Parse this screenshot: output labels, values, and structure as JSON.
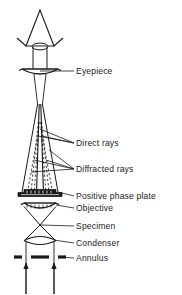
{
  "figure": {
    "kind": "optical-ray-diagram",
    "background_color": "#ffffff",
    "stroke_color": "#1a1a1a",
    "text_color": "#1a1a1a"
  },
  "labels": [
    {
      "id": "eyepiece",
      "text": "Eyepiece",
      "x": 76,
      "y": 74
    },
    {
      "id": "direct-rays",
      "text": "Direct rays",
      "x": 76,
      "y": 146
    },
    {
      "id": "diffracted-rays",
      "text": "Diffracted rays",
      "x": 76,
      "y": 172
    },
    {
      "id": "positive-phase-plate",
      "text": "Positive phase plate",
      "x": 76,
      "y": 199
    },
    {
      "id": "objective",
      "text": "Objective",
      "x": 76,
      "y": 211
    },
    {
      "id": "specimen",
      "text": "Specimen",
      "x": 76,
      "y": 229
    },
    {
      "id": "condenser",
      "text": "Condenser",
      "x": 76,
      "y": 246
    },
    {
      "id": "annulus",
      "text": "Annulus",
      "x": 76,
      "y": 261
    }
  ],
  "components": [
    {
      "id": "eye-cone",
      "name": "observer-eye-cone"
    },
    {
      "id": "eyepiece-lens",
      "name": "eyepiece-lens"
    },
    {
      "id": "phase-plate",
      "name": "positive-phase-plate"
    },
    {
      "id": "objective-lens",
      "name": "objective-lens"
    },
    {
      "id": "specimen-point",
      "name": "specimen-plane"
    },
    {
      "id": "condenser-lens",
      "name": "condenser-lens"
    },
    {
      "id": "annulus-bars",
      "name": "annulus-aperture"
    },
    {
      "id": "light-arrows",
      "name": "illumination-arrows"
    }
  ]
}
